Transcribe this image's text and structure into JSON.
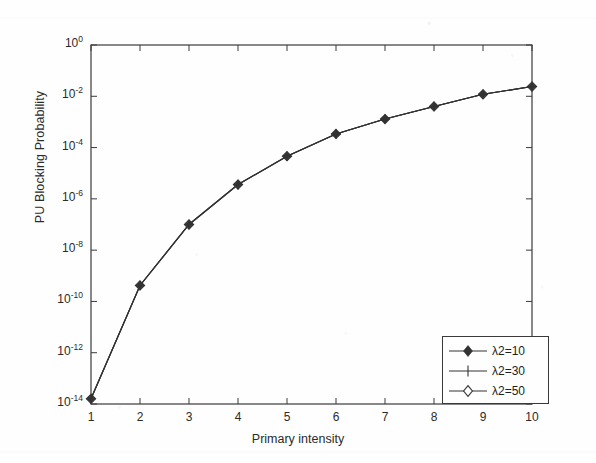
{
  "chart_data": {
    "type": "line",
    "title": "",
    "xlabel": "Primary intensity",
    "ylabel": "PU Blocking Probability",
    "yscale": "log",
    "xscale": "linear",
    "xlim": [
      1,
      10
    ],
    "ylim": [
      1e-14,
      1
    ],
    "grid": false,
    "legend_position": "lower right",
    "x": [
      1,
      2,
      3,
      4,
      5,
      6,
      7,
      8,
      9,
      10
    ],
    "xtick_labels": [
      "1",
      "2",
      "3",
      "4",
      "5",
      "6",
      "7",
      "8",
      "9",
      "10"
    ],
    "ytick_values": [
      1,
      0.01,
      0.0001,
      1e-06,
      1e-08,
      1e-10,
      1e-12,
      1e-14
    ],
    "ytick_labels": [
      "10",
      "10",
      "10",
      "10",
      "10",
      "10",
      "10",
      "10"
    ],
    "ytick_exponents": [
      "0",
      "-2",
      "-4",
      "-6",
      "-8",
      "-10",
      "-12",
      "-14"
    ],
    "series": [
      {
        "name": "λ2=10",
        "marker": "filled-diamond",
        "color": "#333333",
        "values": [
          1.6e-14,
          4.2e-10,
          1e-07,
          3.6e-06,
          4.6e-05,
          0.00034,
          0.0013,
          0.004,
          0.012,
          0.024
        ]
      },
      {
        "name": "λ2=30",
        "marker": "plus",
        "color": "#333333",
        "values": [
          1.6e-14,
          4.2e-10,
          1e-07,
          3.6e-06,
          4.6e-05,
          0.00034,
          0.0013,
          0.004,
          0.012,
          0.024
        ]
      },
      {
        "name": "λ2=50",
        "marker": "open-diamond",
        "color": "#333333",
        "values": [
          1.6e-14,
          4.2e-10,
          1e-07,
          3.6e-06,
          4.6e-05,
          0.00034,
          0.0013,
          0.004,
          0.012,
          0.024
        ]
      }
    ]
  },
  "legend": {
    "entries": [
      {
        "label": "λ2=10",
        "marker": "filled-diamond"
      },
      {
        "label": "λ2=30",
        "marker": "plus"
      },
      {
        "label": "λ2=50",
        "marker": "open-diamond"
      }
    ]
  },
  "axes": {
    "x_title": "Primary intensity",
    "y_title": "PU Blocking Probability"
  },
  "colors": {
    "line": "#333333",
    "axis": "#3a3a3a",
    "background": "#fefefe",
    "text": "#2b2b2b"
  }
}
